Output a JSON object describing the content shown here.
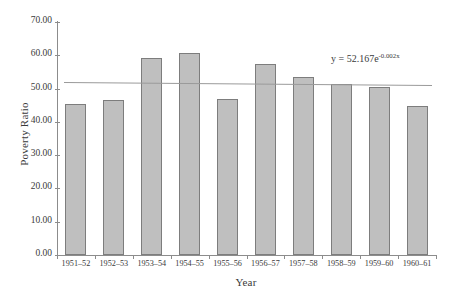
{
  "chart_data": {
    "type": "bar",
    "title": "",
    "xlabel": "Year",
    "ylabel": "Poverty Ratio",
    "categories": [
      "1951–52",
      "1952–53",
      "1953–54",
      "1954–55",
      "1955–56",
      "1956–57",
      "1957–58",
      "1958–59",
      "1959–60",
      "1960–61"
    ],
    "values": [
      45.3,
      46.6,
      59.1,
      60.7,
      47.0,
      57.3,
      53.6,
      51.5,
      50.4,
      44.7
    ],
    "ylim": [
      0,
      70
    ],
    "ytick_labels": [
      "0.00",
      "10.00",
      "20.00",
      "30.00",
      "40.00",
      "50.00",
      "60.00",
      "70.00"
    ],
    "ytick_values": [
      0,
      10,
      20,
      30,
      40,
      50,
      60,
      70
    ],
    "grid": false,
    "legend": false,
    "bar_color": "#bfbfbf",
    "bar_border_color": "#7d7d7d",
    "axis_color": "#8c8c8c",
    "trendline": {
      "type": "exponential",
      "equation_text": "y = 52.167e",
      "equation_exponent": "-0.002x",
      "coefficient": 52.167,
      "rate": -0.002,
      "color": "#9a9a9a",
      "y_start": 52.1,
      "y_end": 51.2
    }
  }
}
